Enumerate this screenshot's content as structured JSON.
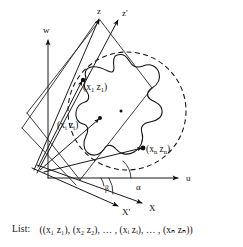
{
  "figure": {
    "axes": [
      {
        "name": "w-axis",
        "label": "w"
      },
      {
        "name": "u-axis",
        "label": "u"
      },
      {
        "name": "z-axis",
        "label": "z"
      },
      {
        "name": "z-prime-axis",
        "label": "z'"
      },
      {
        "name": "x-axis",
        "label": "X"
      },
      {
        "name": "x-prime-axis",
        "label": "X'"
      }
    ],
    "angles": [
      {
        "name": "alpha-angle",
        "label": "α"
      },
      {
        "name": "beta-angle",
        "label": "β"
      }
    ],
    "point_labels": [
      {
        "name": "point-label-1",
        "pre": "(x",
        "sub1": "1",
        "mid": " z",
        "sub2": "1",
        "post": ")"
      },
      {
        "name": "point-label-i",
        "pre": "(x",
        "sub1": "i",
        "mid": " z",
        "sub2": "i",
        "post": ")"
      },
      {
        "name": "point-label-n",
        "pre": "(x",
        "sub1": "n",
        "mid": " z",
        "sub2": "n",
        "post": ")"
      }
    ],
    "colors": {
      "ink": "#111111",
      "background": "#ffffff"
    }
  },
  "caption": {
    "label": "List:",
    "text": "((x₁ z₁),  (x₂ z₂),  … ,  (xᵢ zᵢ),  … ,  (xₙ zₙ))"
  }
}
